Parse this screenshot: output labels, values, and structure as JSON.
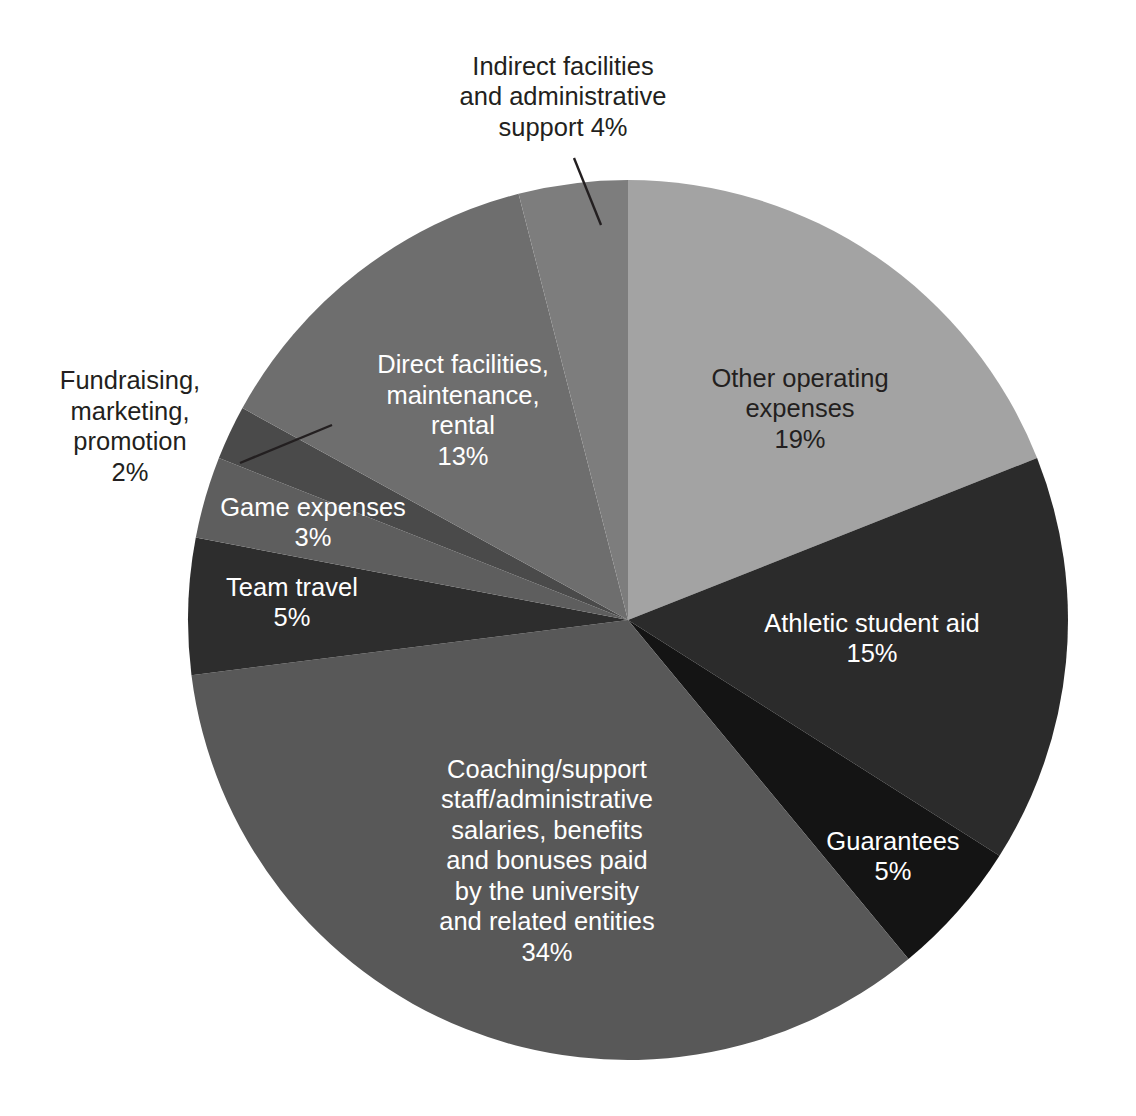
{
  "chart_data": {
    "type": "pie",
    "title": "",
    "subtitle": "",
    "xlabel": "",
    "ylabel": "",
    "legend_position": "none",
    "grid": false,
    "units": "percent",
    "total": 100,
    "start_angle_deg": 0,
    "direction": "clockwise",
    "categories": [
      "Other operating expenses",
      "Athletic student aid",
      "Guarantees",
      "Coaching/support staff/administrative salaries, benefits and bonuses paid by the university and related entities",
      "Team travel",
      "Game expenses",
      "Fundraising, marketing, promotion",
      "Direct facilities, maintenance, rental",
      "Indirect facilities and administrative support"
    ],
    "values": [
      19,
      15,
      5,
      34,
      5,
      3,
      2,
      13,
      4
    ],
    "colors": [
      "#a3a3a3",
      "#2b2b2b",
      "#141414",
      "#585858",
      "#2d2d2d",
      "#5e5e5e",
      "#4a4a4a",
      "#6e6e6e",
      "#7d7d7d"
    ],
    "slices": [
      {
        "name": "Other operating expenses",
        "value": 19,
        "value_label": "19%",
        "color": "#a3a3a3",
        "label_lines": [
          "Other operating",
          "expenses",
          "19%"
        ],
        "label_placement": "inside",
        "label_color": "dark",
        "label_x": 800,
        "label_y": 410,
        "leader": false
      },
      {
        "name": "Athletic student aid",
        "value": 15,
        "value_label": "15%",
        "color": "#2b2b2b",
        "label_lines": [
          "Athletic student aid",
          "15%"
        ],
        "label_placement": "inside",
        "label_color": "light",
        "label_x": 872,
        "label_y": 640,
        "leader": false
      },
      {
        "name": "Guarantees",
        "value": 5,
        "value_label": "5%",
        "color": "#141414",
        "label_lines": [
          "Guarantees",
          "5%"
        ],
        "label_placement": "inside",
        "label_color": "light",
        "label_x": 893,
        "label_y": 858,
        "leader": false
      },
      {
        "name": "Coaching/support staff/administrative salaries, benefits and bonuses paid by the university and related entities",
        "value": 34,
        "value_label": "34%",
        "color": "#585858",
        "label_lines": [
          "Coaching/support",
          "staff/administrative",
          "salaries, benefits",
          "and bonuses paid",
          "by the university",
          "and related entities",
          "34%"
        ],
        "label_placement": "inside",
        "label_color": "light",
        "label_x": 547,
        "label_y": 862,
        "leader": false
      },
      {
        "name": "Team travel",
        "value": 5,
        "value_label": "5%",
        "color": "#2d2d2d",
        "label_lines": [
          "Team travel",
          "5%"
        ],
        "label_placement": "inside",
        "label_color": "light",
        "label_x": 292,
        "label_y": 604,
        "leader": false
      },
      {
        "name": "Game expenses",
        "value": 3,
        "value_label": "3%",
        "color": "#5e5e5e",
        "label_lines": [
          "Game expenses",
          "3%"
        ],
        "label_placement": "inside",
        "label_color": "light",
        "label_x": 313,
        "label_y": 524,
        "leader": false
      },
      {
        "name": "Fundraising, marketing, promotion",
        "value": 2,
        "value_label": "2%",
        "color": "#4a4a4a",
        "label_lines": [
          "Fundraising,",
          "marketing,",
          "promotion",
          "2%"
        ],
        "label_placement": "outside",
        "label_color": "outside",
        "label_x": 130,
        "label_y": 428,
        "leader": true,
        "leader_points": [
          [
            240,
            463
          ],
          [
            332,
            425
          ]
        ]
      },
      {
        "name": "Direct facilities, maintenance, rental",
        "value": 13,
        "value_label": "13%",
        "color": "#6e6e6e",
        "label_lines": [
          "Direct facilities,",
          "maintenance,",
          "rental",
          "13%"
        ],
        "label_placement": "inside",
        "label_color": "light",
        "label_x": 463,
        "label_y": 412,
        "leader": false
      },
      {
        "name": "Indirect facilities and administrative support",
        "value": 4,
        "value_label": "4%",
        "color": "#7d7d7d",
        "label_lines": [
          "Indirect facilities",
          "and administrative",
          "support 4%"
        ],
        "label_placement": "outside",
        "label_color": "outside",
        "label_x": 563,
        "label_y": 98,
        "leader": true,
        "leader_points": [
          [
            601,
            225
          ],
          [
            574,
            158
          ]
        ]
      }
    ],
    "geometry": {
      "center_x": 628,
      "center_y": 620,
      "radius": 440
    }
  },
  "caption": {
    "text": ""
  }
}
